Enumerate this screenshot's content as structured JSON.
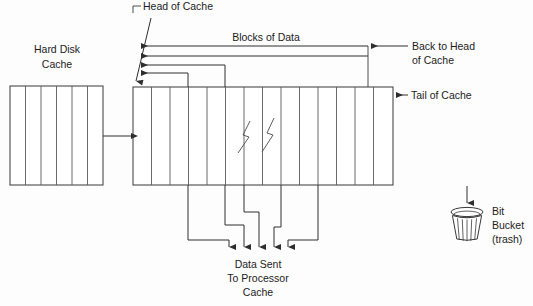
{
  "diagram": {
    "colors": {
      "background": "#fdfdfd",
      "line": "#3a3a3a",
      "box_stroke": "#4a4a4a",
      "text": "#1c1c1c"
    },
    "labels": {
      "head_of_cache": "Head of Cache",
      "blocks_of_data": "Blocks of Data",
      "back_to_head_line1": "Back to Head",
      "back_to_head_line2": "of Cache",
      "tail_of_cache": "Tail of Cache",
      "hard_disk_line1": "Hard Disk",
      "hard_disk_line2": "Cache",
      "data_sent_line1": "Data Sent",
      "data_sent_line2": "To Processor",
      "data_sent_line3": "Cache",
      "bit_bucket_line1": "Bit",
      "bit_bucket_line2": "Bucket",
      "bit_bucket_line3": "(trash)"
    },
    "hard_disk_cache": {
      "name": "Hard Disk Cache",
      "cell_count": 6,
      "x": 10,
      "y": 86,
      "width": 93,
      "height": 99
    },
    "main_cache": {
      "name": "Cache",
      "cell_count": 14,
      "x": 133,
      "y": 87,
      "width": 260,
      "height": 98,
      "break_marks": 2
    },
    "feed_arrow": {
      "name": "disk-to-cache-arrow",
      "from_x": 103,
      "to_x": 133,
      "y": 136
    },
    "head_arrows": {
      "count": 4,
      "tip_x": 139,
      "y_values": [
        46,
        56,
        65,
        73
      ]
    },
    "output_arrows": {
      "count": 5,
      "tip_y": 250,
      "x_values": [
        229,
        244,
        259,
        274,
        288
      ]
    },
    "bit_bucket": {
      "name": "Bit Bucket",
      "arrow_from_y": 186,
      "arrow_to_y": 206,
      "arrow_x": 467,
      "can_x": 452,
      "can_y": 208,
      "can_width": 31,
      "can_height": 31
    }
  }
}
